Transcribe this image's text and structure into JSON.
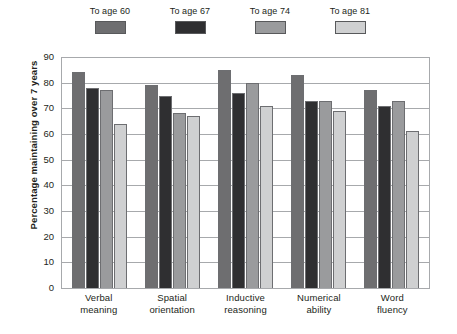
{
  "chart_data": {
    "type": "bar",
    "title": "",
    "xlabel": "",
    "ylabel": "Percentage maintaining over 7 years",
    "ylim": [
      0,
      90
    ],
    "yticks": [
      0,
      10,
      20,
      30,
      40,
      50,
      60,
      70,
      80,
      90
    ],
    "grid": true,
    "legend_position": "top",
    "categories": [
      "Verbal meaning",
      "Spatial orientation",
      "Inductive reasoning",
      "Numerical ability",
      "Word fluency"
    ],
    "category_lines": [
      [
        "Verbal",
        "meaning"
      ],
      [
        "Spatial",
        "orientation"
      ],
      [
        "Inductive",
        "reasoning"
      ],
      [
        "Numerical",
        "ability"
      ],
      [
        "Word",
        "fluency"
      ]
    ],
    "series": [
      {
        "name": "To age 60",
        "color": "#6e6e70",
        "values": [
          84,
          79,
          85,
          83,
          77
        ]
      },
      {
        "name": "To age 67",
        "color": "#2f2f31",
        "values": [
          78,
          75,
          76,
          73,
          71
        ]
      },
      {
        "name": "To age 74",
        "color": "#9a9b9d",
        "values": [
          77,
          68,
          80,
          73,
          73
        ]
      },
      {
        "name": "To age 81",
        "color": "#cfd0d1",
        "values": [
          64,
          67,
          71,
          69,
          61
        ]
      }
    ]
  },
  "legend": {
    "items": [
      {
        "label": "To age 60"
      },
      {
        "label": "To age 67"
      },
      {
        "label": "To age 74"
      },
      {
        "label": "To age 81"
      }
    ]
  }
}
